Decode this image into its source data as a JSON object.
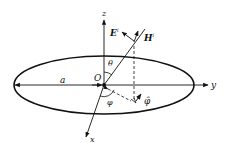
{
  "diagram": {
    "title": "",
    "colors": {
      "stroke": "#111111",
      "background": "#ffffff"
    },
    "labels": {
      "z_axis": "z",
      "y_axis": "y",
      "x_axis": "x",
      "origin": "O",
      "radius": "a",
      "theta": "θ",
      "phi": "φ",
      "phi_hat": "φ̂",
      "E_field": "E",
      "E_sup": "i",
      "H_field": "H",
      "H_sup": "i"
    },
    "elements": [
      {
        "type": "ellipse",
        "name": "loop",
        "center": [
          104,
          85
        ],
        "rx": 90,
        "ry": 29
      },
      {
        "type": "axis",
        "name": "z-axis",
        "from": [
          104,
          85
        ],
        "to": [
          104,
          20
        ]
      },
      {
        "type": "axis",
        "name": "y-axis",
        "from": [
          14,
          85
        ],
        "to": [
          208,
          85
        ]
      },
      {
        "type": "axis",
        "name": "x-axis",
        "from": [
          104,
          85
        ],
        "to": [
          86,
          137
        ]
      },
      {
        "type": "ray",
        "name": "incident-direction",
        "from": [
          104,
          85
        ],
        "to": [
          144,
          30
        ]
      },
      {
        "type": "vector",
        "name": "E-vector",
        "from": [
          135,
          40
        ],
        "to": [
          122,
          32
        ]
      },
      {
        "type": "vector",
        "name": "H-vector",
        "from": [
          135,
          43
        ],
        "to": [
          139,
          32
        ]
      },
      {
        "type": "dashed",
        "name": "projection-vertical",
        "from": [
          134,
          46
        ],
        "to": [
          134,
          100
        ]
      },
      {
        "type": "dashed",
        "name": "projection-radial",
        "from": [
          107,
          88
        ],
        "to": [
          132,
          101
        ]
      }
    ]
  }
}
